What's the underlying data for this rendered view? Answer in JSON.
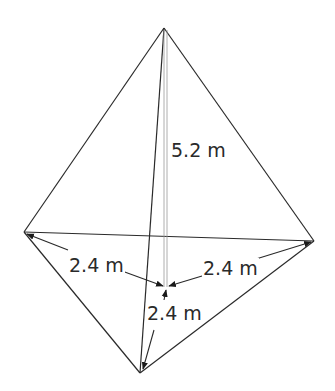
{
  "diagram": {
    "type": "triangular pyramid (tetrahedron) with labeled height and base distances",
    "labels": {
      "height": "5.2 m",
      "left_distance": "2.4 m",
      "right_distance": "2.4 m",
      "bottom_distance": "2.4 m"
    },
    "colors": {
      "line": "#2a2a2a",
      "height_line": "#9a9a9a",
      "background": "#ffffff"
    }
  }
}
